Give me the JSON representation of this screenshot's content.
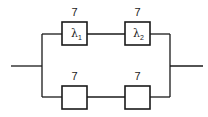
{
  "diagram": {
    "type": "reliability-block-diagram",
    "branches": [
      {
        "name": "top",
        "blocks": [
          {
            "label_above": "7",
            "symbol": "λ",
            "subscript": "1"
          },
          {
            "label_above": "7",
            "symbol": "λ",
            "subscript": "2"
          }
        ]
      },
      {
        "name": "bottom",
        "blocks": [
          {
            "label_above": "7",
            "symbol": "",
            "subscript": ""
          },
          {
            "label_above": "7",
            "symbol": "",
            "subscript": ""
          }
        ]
      }
    ],
    "line_color": "#1a1a1a"
  }
}
